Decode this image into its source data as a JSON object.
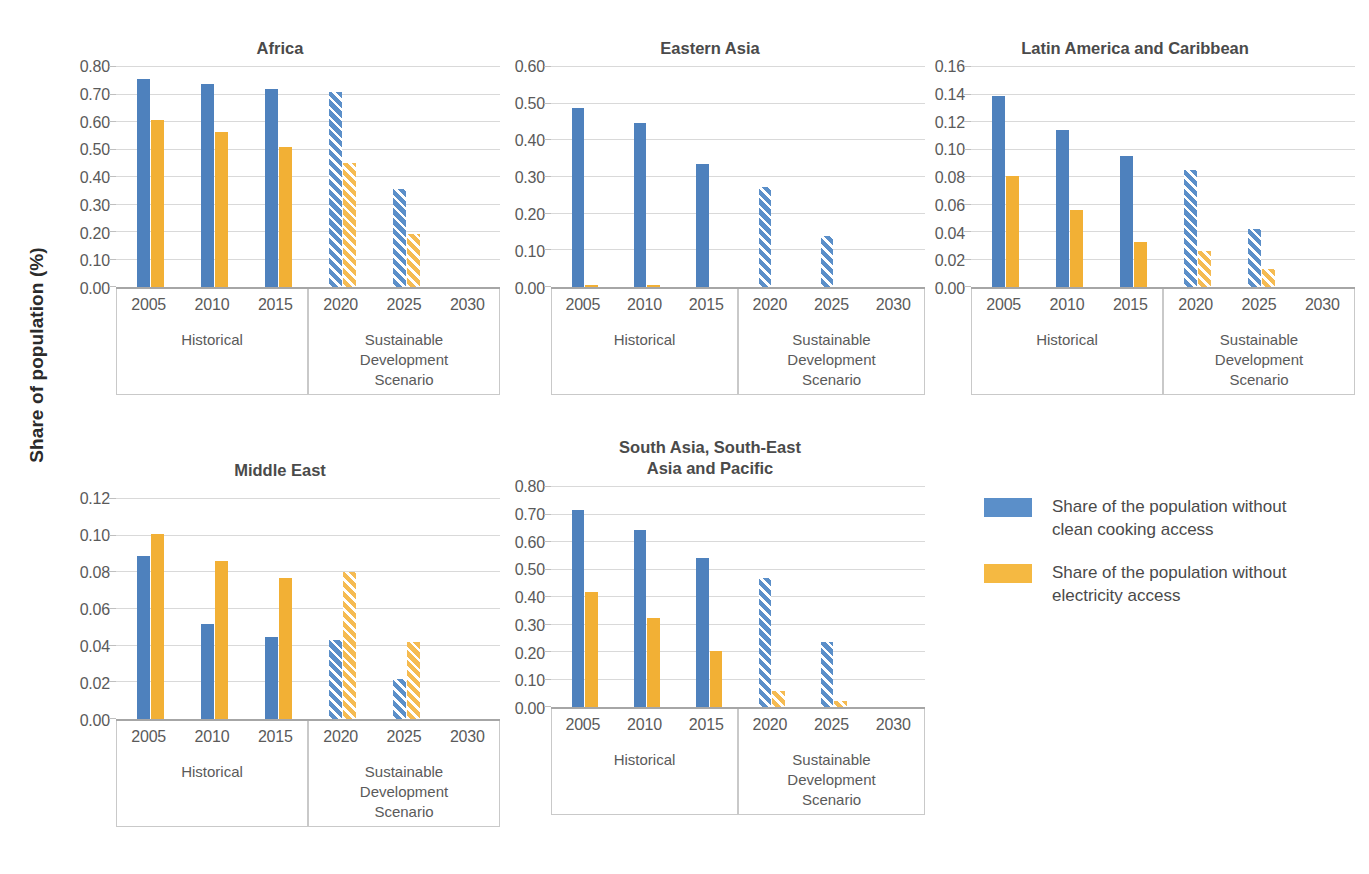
{
  "axis_title": "Share of population (%)",
  "groups": {
    "historical": "Historical",
    "scenario": "Sustainable\nDevelopment\nScenario"
  },
  "legend": {
    "items": [
      {
        "color": "#5B8FC9",
        "swatch": "blue",
        "label": "Share of the population without\nclean cooking access"
      },
      {
        "color": "#F5B942",
        "swatch": "orange",
        "label": "Share of the population without\nelectricity access"
      }
    ]
  },
  "colors": {
    "clean_cooking": "#4E81BD",
    "electricity": "#F2B035",
    "clean_cooking_projected": "#5B8FC9",
    "electricity_projected": "#F5BB52",
    "gridline": "#D9D9D9",
    "axis": "#A6A6A6",
    "text": "#5A5A5A",
    "title": "#4A4A4A"
  },
  "chart_data": {
    "type": "bar",
    "title": "",
    "xlabel": "",
    "ylabel": "Share of population (%)",
    "grid": true,
    "legend_position": "right",
    "categories": [
      "2005",
      "2010",
      "2015",
      "2020",
      "2025",
      "2030"
    ],
    "historical_categories": [
      "2005",
      "2010",
      "2015"
    ],
    "projected_categories": [
      "2020",
      "2025",
      "2030"
    ],
    "series_names": [
      "Share of the population without clean cooking access",
      "Share of the population without electricity access"
    ],
    "panels": [
      {
        "title": "Africa",
        "ylim": [
          0.0,
          0.8
        ],
        "yticks": [
          "0.00",
          "0.10",
          "0.20",
          "0.30",
          "0.40",
          "0.50",
          "0.60",
          "0.70",
          "0.80"
        ],
        "ytick_values": [
          0.0,
          0.1,
          0.2,
          0.3,
          0.4,
          0.5,
          0.6,
          0.7,
          0.8
        ],
        "series": [
          {
            "name": "Share of the population without clean cooking access",
            "values": [
              0.755,
              0.74,
              0.72,
              0.708,
              0.358,
              0.0
            ]
          },
          {
            "name": "Share of the population without electricity access",
            "values": [
              0.608,
              0.563,
              0.508,
              0.45,
              0.192,
              0.0
            ]
          }
        ]
      },
      {
        "title": "Eastern Asia",
        "ylim": [
          0.0,
          0.6
        ],
        "yticks": [
          "0.00",
          "0.10",
          "0.20",
          "0.30",
          "0.40",
          "0.50",
          "0.60"
        ],
        "ytick_values": [
          0.0,
          0.1,
          0.2,
          0.3,
          0.4,
          0.5,
          0.6
        ],
        "series": [
          {
            "name": "Share of the population without clean cooking access",
            "values": [
              0.488,
              0.448,
              0.335,
              0.273,
              0.138,
              0.0
            ]
          },
          {
            "name": "Share of the population without electricity access",
            "values": [
              0.006,
              0.006,
              0.0,
              0.0,
              0.0,
              0.0
            ]
          }
        ]
      },
      {
        "title": "Latin America and Caribbean",
        "ylim": [
          0.0,
          0.16
        ],
        "yticks": [
          "0.00",
          "0.02",
          "0.04",
          "0.06",
          "0.08",
          "0.10",
          "0.12",
          "0.14",
          "0.16"
        ],
        "ytick_values": [
          0.0,
          0.02,
          0.04,
          0.06,
          0.08,
          0.1,
          0.12,
          0.14,
          0.16
        ],
        "series": [
          {
            "name": "Share of the population without clean cooking access",
            "values": [
              0.139,
              0.114,
              0.095,
              0.085,
              0.042,
              0.0
            ]
          },
          {
            "name": "Share of the population without electricity access",
            "values": [
              0.081,
              0.056,
              0.033,
              0.026,
              0.013,
              0.0
            ]
          }
        ]
      },
      {
        "title": "Middle East",
        "ylim": [
          0.0,
          0.12
        ],
        "yticks": [
          "0.00",
          "0.02",
          "0.04",
          "0.06",
          "0.08",
          "0.10",
          "0.12"
        ],
        "ytick_values": [
          0.0,
          0.02,
          0.04,
          0.06,
          0.08,
          0.1,
          0.12
        ],
        "series": [
          {
            "name": "Share of the population without clean cooking access",
            "values": [
              0.089,
              0.052,
              0.045,
              0.043,
              0.022,
              0.0
            ]
          },
          {
            "name": "Share of the population without electricity access",
            "values": [
              0.101,
              0.086,
              0.077,
              0.08,
              0.042,
              0.0
            ]
          }
        ]
      },
      {
        "title": "South Asia, South-East\nAsia and Pacific",
        "ylim": [
          0.0,
          0.8
        ],
        "yticks": [
          "0.00",
          "0.10",
          "0.20",
          "0.30",
          "0.40",
          "0.50",
          "0.60",
          "0.70",
          "0.80"
        ],
        "ytick_values": [
          0.0,
          0.1,
          0.2,
          0.3,
          0.4,
          0.5,
          0.6,
          0.7,
          0.8
        ],
        "series": [
          {
            "name": "Share of the population without clean cooking access",
            "values": [
              0.715,
              0.645,
              0.543,
              0.468,
              0.236,
              0.0
            ]
          },
          {
            "name": "Share of the population without electricity access",
            "values": [
              0.42,
              0.325,
              0.204,
              0.059,
              0.022,
              0.0
            ]
          }
        ]
      }
    ]
  }
}
